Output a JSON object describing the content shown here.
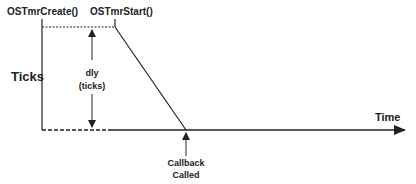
{
  "diagram": {
    "labels": {
      "create": "OSTmrCreate()",
      "start": "OSTmrStart()",
      "y_axis": "Ticks",
      "x_axis": "Time",
      "dly_line1": "dly",
      "dly_line2": "(ticks)",
      "callback_line1": "Callback",
      "callback_line2": "Called"
    },
    "colors": {
      "stroke": "#222222",
      "text": "#222222",
      "background": "#ffffff"
    }
  }
}
